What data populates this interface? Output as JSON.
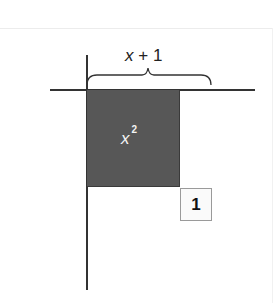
{
  "diagram": {
    "type": "algebra-tiles",
    "brace_label": {
      "variable": "x",
      "operator": "+",
      "constant": "1"
    },
    "square_tile": {
      "base": "x",
      "exponent": "2",
      "fill_color": "#575757",
      "text_color": "#f4f4f4"
    },
    "unit_tile": {
      "label": "1",
      "fill_color": "#fafafa",
      "border_color": "#9a9a9a"
    },
    "axis_color": "#333333"
  }
}
